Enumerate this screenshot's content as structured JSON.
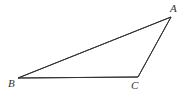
{
  "figure": {
    "kind": "geometry-diagram",
    "shape": "triangle",
    "background_color": "#ffffff",
    "stroke_color": "#333333",
    "stroke_width": 1,
    "canvas": {
      "width": 190,
      "height": 96
    },
    "vertices": [
      {
        "id": "A",
        "label": "A",
        "x": 171,
        "y": 17,
        "label_x": 176,
        "label_y": 9,
        "label_position": "above-right"
      },
      {
        "id": "B",
        "label": "B",
        "x": 18,
        "y": 78,
        "label_x": 12,
        "label_y": 85,
        "label_position": "below-left"
      },
      {
        "id": "C",
        "label": "C",
        "x": 138,
        "y": 77,
        "label_x": 135,
        "label_y": 87,
        "label_position": "below"
      }
    ],
    "edges": [
      {
        "id": "AB",
        "from": "A",
        "to": "B",
        "label": ""
      },
      {
        "id": "BC",
        "from": "B",
        "to": "C",
        "label": ""
      },
      {
        "id": "CA",
        "from": "C",
        "to": "A",
        "label": ""
      }
    ]
  },
  "chart_data": {
    "type": "scatter",
    "title": "",
    "xlabel": "",
    "ylabel": "",
    "points": [
      {
        "name": "A",
        "x": 171,
        "y": 17
      },
      {
        "name": "B",
        "x": 18,
        "y": 78
      },
      {
        "name": "C",
        "x": 138,
        "y": 77
      }
    ],
    "connections": [
      [
        "A",
        "B"
      ],
      [
        "B",
        "C"
      ],
      [
        "C",
        "A"
      ]
    ],
    "grid": false,
    "legend": "none"
  }
}
